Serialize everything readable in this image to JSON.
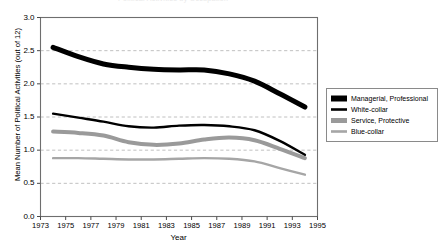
{
  "figure": {
    "clipped_top_text": "Political Activities by Occupation",
    "background_color": "#ffffff",
    "frame_color": "#6e6e6e",
    "grid_color": "#b9b9b9"
  },
  "chart_data": {
    "type": "line",
    "title": "",
    "xlabel": "Year",
    "ylabel": "Mean Number of Political Activities (out of 12)",
    "xlim": [
      1973,
      1995
    ],
    "ylim": [
      0.0,
      3.0
    ],
    "grid": true,
    "grid_axis": "y",
    "grid_style": "dashed",
    "legend_position": "right-middle",
    "ytick_labels": [
      "0.0",
      "0.5",
      "1.0",
      "1.5",
      "2.0",
      "2.5",
      "3.0"
    ],
    "ytick_values": [
      0.0,
      0.5,
      1.0,
      1.5,
      2.0,
      2.5,
      3.0
    ],
    "xtick_labels": [
      "1973",
      "1975",
      "1977",
      "1979",
      "1981",
      "1983",
      "1985",
      "1987",
      "1989",
      "1991",
      "1993",
      "1995"
    ],
    "xtick_values": [
      1973,
      1975,
      1977,
      1979,
      1981,
      1983,
      1985,
      1987,
      1989,
      1991,
      1993,
      1995
    ],
    "x": [
      1974,
      1976,
      1978,
      1980,
      1982,
      1984,
      1986,
      1988,
      1990,
      1992,
      1994
    ],
    "series": [
      {
        "name": "Managerial, Professional",
        "color": "#000000",
        "width": 5.0,
        "values": [
          2.55,
          2.41,
          2.3,
          2.25,
          2.22,
          2.21,
          2.21,
          2.15,
          2.04,
          1.85,
          1.65
        ]
      },
      {
        "name": "White-collar",
        "color": "#000000",
        "width": 2.4,
        "values": [
          1.55,
          1.49,
          1.43,
          1.36,
          1.34,
          1.37,
          1.38,
          1.36,
          1.3,
          1.14,
          0.93
        ]
      },
      {
        "name": "Service, Protective",
        "color": "#9a9a9a",
        "width": 4.0,
        "values": [
          1.28,
          1.26,
          1.22,
          1.12,
          1.08,
          1.1,
          1.16,
          1.19,
          1.15,
          1.02,
          0.88
        ]
      },
      {
        "name": "Blue-collar",
        "color": "#a6a6a6",
        "width": 2.4,
        "values": [
          0.88,
          0.88,
          0.87,
          0.86,
          0.86,
          0.87,
          0.88,
          0.87,
          0.83,
          0.73,
          0.63
        ]
      }
    ]
  },
  "legend": {
    "items": [
      {
        "label": "Managerial, Professional",
        "color": "#000000",
        "thickness": 5
      },
      {
        "label": "White-collar",
        "color": "#000000",
        "thickness": 2.5
      },
      {
        "label": "Service, Protective",
        "color": "#9a9a9a",
        "thickness": 4
      },
      {
        "label": "Blue-collar",
        "color": "#a6a6a6",
        "thickness": 2.5
      }
    ]
  }
}
